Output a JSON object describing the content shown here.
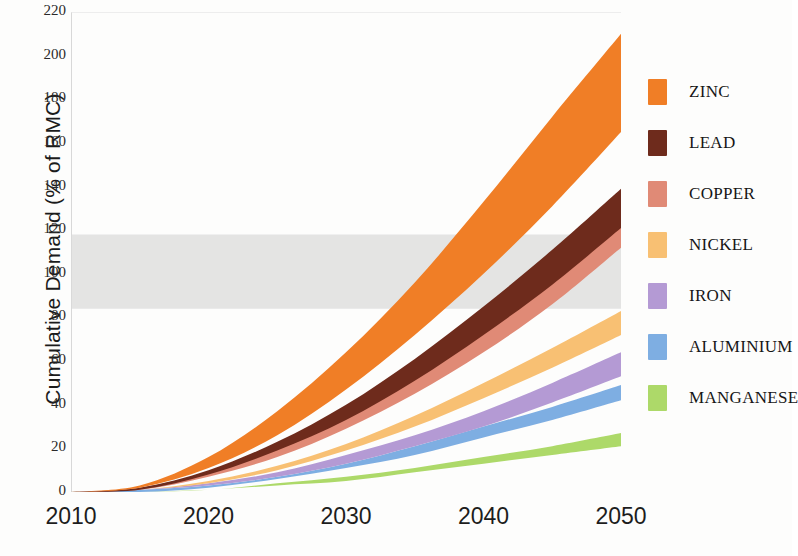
{
  "chart_data": {
    "type": "area",
    "title": "",
    "xlabel": "",
    "ylabel": "Cumulative Demand (% of RMC)",
    "xlim": [
      2010,
      2050
    ],
    "ylim": [
      0,
      220
    ],
    "x_ticks": [
      2010,
      2020,
      2030,
      2040,
      2050
    ],
    "y_ticks": [
      0,
      20,
      40,
      60,
      80,
      100,
      120,
      140,
      160,
      180,
      200,
      220
    ],
    "grid": false,
    "legend_position": "right",
    "x": [
      2010,
      2015,
      2020,
      2025,
      2030,
      2035,
      2040,
      2045,
      2050
    ],
    "reference_band": {
      "name": "RMC reference range",
      "low": 84,
      "high": 118,
      "color": "#d9d9d9"
    },
    "series": [
      {
        "name": "ZINC",
        "color": "#F07E26",
        "low": [
          0,
          2,
          11,
          26,
          47,
          72,
          100,
          131,
          165
        ],
        "high": [
          0,
          3,
          16,
          37,
          64,
          96,
          133,
          172,
          210
        ]
      },
      {
        "name": "LEAD",
        "color": "#6E2B1C",
        "low": [
          0,
          1,
          8,
          19,
          33,
          51,
          72,
          95,
          121
        ],
        "high": [
          0,
          2,
          10,
          23,
          40,
          61,
          85,
          111,
          139
        ]
      },
      {
        "name": "COPPER",
        "color": "#E08A76",
        "low": [
          0,
          1,
          7,
          16,
          29,
          45,
          64,
          86,
          112
        ],
        "high": [
          0,
          2,
          9,
          20,
          35,
          54,
          76,
          101,
          130
        ]
      },
      {
        "name": "NICKEL",
        "color": "#F8C073",
        "low": [
          0,
          1,
          4,
          10,
          19,
          30,
          43,
          57,
          72
        ],
        "high": [
          0,
          1,
          5,
          12,
          22,
          35,
          50,
          66,
          83
        ]
      },
      {
        "name": "IRON",
        "color": "#B49AD4",
        "low": [
          0,
          1,
          3,
          7,
          13,
          21,
          30,
          41,
          53
        ],
        "high": [
          0,
          1,
          4,
          9,
          17,
          26,
          37,
          50,
          64
        ]
      },
      {
        "name": "ALUMINIUM",
        "color": "#7EAEE2",
        "low": [
          0,
          0,
          2,
          6,
          11,
          17,
          25,
          33,
          42
        ],
        "high": [
          0,
          1,
          3,
          7,
          13,
          21,
          30,
          39,
          49
        ]
      },
      {
        "name": "MANGANESE",
        "color": "#ADD969",
        "low": [
          0,
          0,
          1,
          3,
          5,
          9,
          13,
          17,
          21
        ],
        "high": [
          0,
          0,
          1,
          4,
          7,
          11,
          16,
          21,
          27
        ]
      }
    ]
  },
  "legend": {
    "items": [
      {
        "label": "ZINC",
        "color": "#F07E26"
      },
      {
        "label": "LEAD",
        "color": "#6E2B1C"
      },
      {
        "label": "COPPER",
        "color": "#E08A76"
      },
      {
        "label": "NICKEL",
        "color": "#F8C073"
      },
      {
        "label": "IRON",
        "color": "#B49AD4"
      },
      {
        "label": "ALUMINIUM",
        "color": "#7EAEE2"
      },
      {
        "label": "MANGANESE",
        "color": "#ADD969"
      }
    ]
  }
}
